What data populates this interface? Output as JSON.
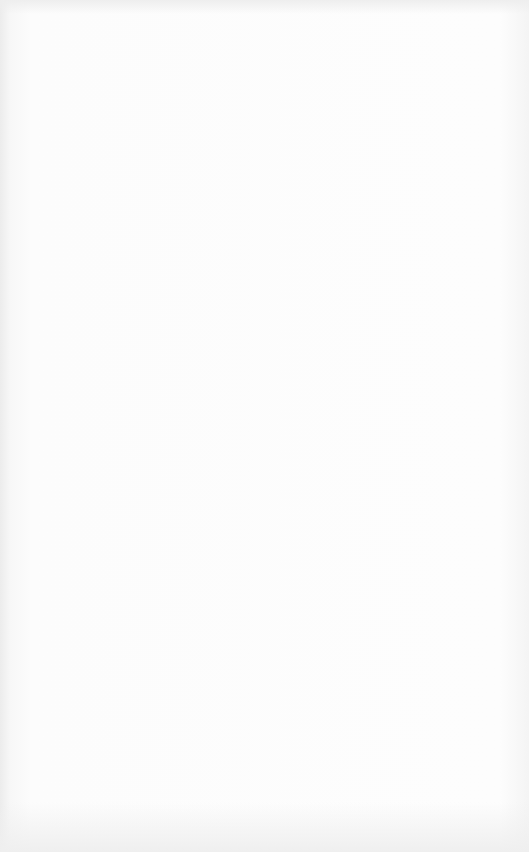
{
  "image": {
    "subject": "blank lined notebook paper",
    "line_count": 32,
    "colors": {
      "paper": "#fbfbfb",
      "rule_line": "#a3a3a3"
    }
  }
}
